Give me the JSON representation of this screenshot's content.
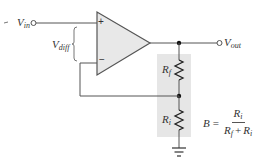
{
  "diagram": {
    "colors": {
      "wire": "#555555",
      "opamp_fill": "#e8e8e8",
      "feedback_network_fill": "#e6e6e6",
      "text": "#333333"
    },
    "opamp": {
      "plus_sign": "+",
      "minus_sign": "−"
    },
    "labels": {
      "vin": {
        "base": "V",
        "sub": "in"
      },
      "vout": {
        "base": "V",
        "sub": "out"
      },
      "vdiff": {
        "base": "V",
        "sub": "diff"
      },
      "rf": {
        "base": "R",
        "sub": "f"
      },
      "ri": {
        "base": "R",
        "sub": "i"
      }
    },
    "formula": {
      "lhs": "B",
      "equals": "=",
      "numerator": {
        "base": "R",
        "sub": "i"
      },
      "denominator": {
        "term1": {
          "base": "R",
          "sub": "f"
        },
        "plus": "+",
        "term2": {
          "base": "R",
          "sub": "i"
        }
      }
    },
    "leading_mark": "-"
  }
}
